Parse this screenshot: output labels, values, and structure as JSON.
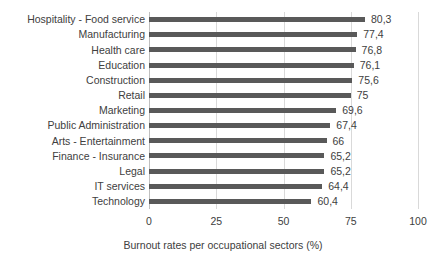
{
  "chart_data": {
    "type": "bar",
    "orientation": "horizontal",
    "title": "",
    "xlabel": "Burnout rates per occupational sectors (%)",
    "ylabel": "",
    "xlim": [
      0,
      100
    ],
    "xticks": [
      "0",
      "25",
      "50",
      "75",
      "100"
    ],
    "xtick_values": [
      0,
      25,
      50,
      75,
      100
    ],
    "grid": true,
    "legend": false,
    "bar_color": "#595959",
    "gridline_color": "#d9d9d9",
    "axis_color": "#bfbfbf",
    "text_color": "#404040",
    "decimal_separator": ",",
    "categories": [
      "Hospitality - Food service",
      "Manufacturing",
      "Health care",
      "Education",
      "Construction",
      "Retail",
      "Marketing",
      "Public Administration",
      "Arts - Entertainment",
      "Finance - Insurance",
      "Legal",
      "IT services",
      "Technology"
    ],
    "values": [
      80.3,
      77.4,
      76.8,
      76.1,
      75.6,
      75,
      69.6,
      67.4,
      66,
      65.2,
      65.2,
      64.4,
      60.4
    ],
    "data_labels": [
      "80,3",
      "77,4",
      "76,8",
      "76,1",
      "75,6",
      "75",
      "69,6",
      "67,4",
      "66",
      "65,2",
      "65,2",
      "64,4",
      "60,4"
    ]
  }
}
